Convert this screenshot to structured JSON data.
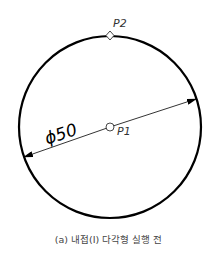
{
  "diagram": {
    "circle": {
      "diameter_label": "ϕ50",
      "stroke": "#000000"
    },
    "points": [
      {
        "name": "P1",
        "label": "P1",
        "role": "center"
      },
      {
        "name": "P2",
        "label": "P2",
        "role": "top quadrant"
      }
    ]
  },
  "caption": "(a) 내접(I) 다각형 실행 전"
}
